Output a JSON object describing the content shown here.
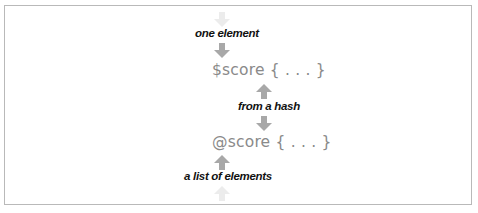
{
  "diagram": {
    "labels": {
      "one_element": "one element",
      "from_a_hash": "from a hash",
      "a_list_of_elements": "a list of elements"
    },
    "code": {
      "scalar": "$score { . . . }",
      "array": "@score { . . . }"
    },
    "colors": {
      "frame": "#b9b9b9",
      "arrow": "#a8a8a8",
      "arrow_faded": "#e6e6e6",
      "code_text": "#8a8a8a",
      "label_text": "#111111"
    }
  }
}
